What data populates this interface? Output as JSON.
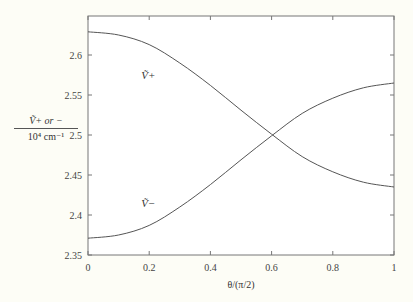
{
  "chart_data": {
    "type": "line",
    "title": "",
    "xlabel": "θ/(π/2)",
    "ylabel": "Ṽ+ or − / 10^4 cm^-1",
    "ylabel_numerator": "Ṽ+ or −",
    "ylabel_denominator": "10⁴ cm⁻¹",
    "xlim": [
      0,
      1
    ],
    "ylim": [
      2.35,
      2.65
    ],
    "x_ticks": [
      0,
      0.2,
      0.4,
      0.6,
      0.8,
      1
    ],
    "x_tick_labels": [
      "0",
      "0.2",
      "0.4",
      "0.6",
      "0.8",
      "1"
    ],
    "y_ticks": [
      2.35,
      2.4,
      2.45,
      2.5,
      2.55,
      2.6
    ],
    "y_tick_labels": [
      "2.35",
      "2.4",
      "2.45",
      "2.5",
      "2.55",
      "2.6"
    ],
    "grid": false,
    "legend": "none (inline curve labels)",
    "x": [
      0,
      0.1,
      0.2,
      0.3,
      0.4,
      0.5,
      0.6,
      0.7,
      0.8,
      0.9,
      1.0
    ],
    "series": [
      {
        "name": "Ṽ+",
        "label_pos": [
          0.2,
          2.57
        ],
        "values": [
          2.629,
          2.625,
          2.613,
          2.59,
          2.562,
          2.531,
          2.501,
          2.473,
          2.454,
          2.441,
          2.435
        ]
      },
      {
        "name": "Ṽ−",
        "label_pos": [
          0.2,
          2.41
        ],
        "values": [
          2.371,
          2.375,
          2.387,
          2.41,
          2.438,
          2.469,
          2.499,
          2.527,
          2.546,
          2.559,
          2.565
        ]
      }
    ]
  }
}
